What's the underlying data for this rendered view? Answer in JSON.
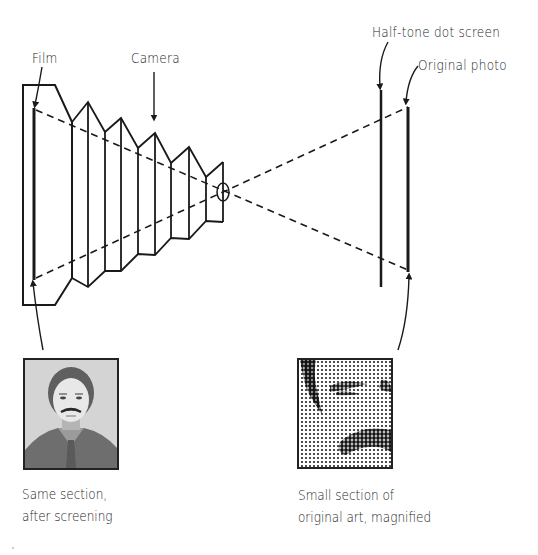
{
  "labels": {
    "film": "Film",
    "camera": "Camera",
    "halftone_screen": "Half-tone dot screen",
    "original_photo": "Original photo"
  },
  "captions": {
    "left_line1": "Same section,",
    "left_line2": "after screening",
    "right_line1": "Small section of",
    "right_line2": "original art, magnified"
  },
  "photos": {
    "left": "screened-portrait",
    "right": "magnified-halftone-detail"
  },
  "colors": {
    "ink": "#1a1a1a",
    "background": "#ffffff"
  }
}
